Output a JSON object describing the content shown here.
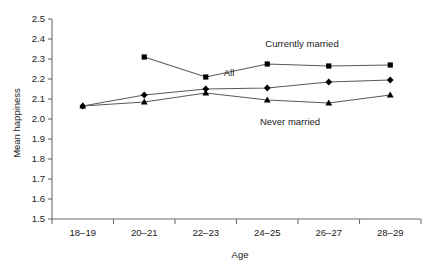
{
  "chart_data": {
    "type": "line",
    "title": "",
    "xlabel": "Age",
    "ylabel": "Mean happiness",
    "categories": [
      "18–19",
      "20–21",
      "22–23",
      "24–25",
      "26–27",
      "28–29"
    ],
    "ylim": [
      1.5,
      2.5
    ],
    "ytick_step": 0.1,
    "yticks": [
      "2.5",
      "2.4",
      "2.3",
      "2.2",
      "2.1",
      "2.0",
      "1.9",
      "1.8",
      "1.7",
      "1.6",
      "1.5"
    ],
    "grid": false,
    "legend_position": "inline-annotations",
    "series": [
      {
        "name": "Currently married",
        "marker": "square",
        "values": [
          null,
          2.31,
          2.21,
          2.275,
          2.265,
          2.27
        ],
        "label_text": "Currently married"
      },
      {
        "name": "All",
        "marker": "diamond",
        "values": [
          2.065,
          2.12,
          2.15,
          2.155,
          2.185,
          2.195
        ],
        "label_text": "All"
      },
      {
        "name": "Never married",
        "marker": "triangle",
        "values": [
          2.065,
          2.085,
          2.13,
          2.095,
          2.08,
          2.12
        ],
        "label_text": "Never married"
      }
    ],
    "annotations": [
      {
        "text": "Currently married",
        "x_px": 302,
        "y_px": 47
      },
      {
        "text": "All",
        "x_px": 229,
        "y_px": 76
      },
      {
        "text": "Never married",
        "x_px": 290,
        "y_px": 125
      }
    ],
    "colors": {
      "line": "#5a5a5a",
      "marker": "#000000",
      "axis": "#6e6e6e",
      "text": "#1a1a1a",
      "background": "#ffffff"
    }
  },
  "axis_labels": {
    "y_title": "Mean happiness",
    "x_title": "Age"
  }
}
